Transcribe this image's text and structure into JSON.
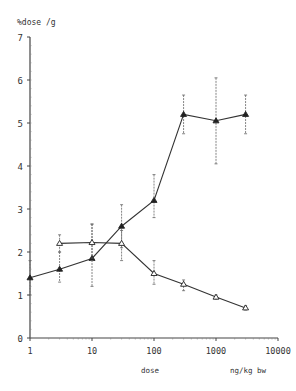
{
  "chart_data": {
    "type": "line",
    "title": "",
    "ylabel": "%dose /g",
    "xlabel": "dose",
    "xunit": "ng/kg bw",
    "xscale": "log",
    "xlim": [
      1,
      10000
    ],
    "ylim": [
      0,
      7
    ],
    "x_ticks": [
      "1",
      "10",
      "100",
      "1000",
      "10000"
    ],
    "y_ticks": [
      "0",
      "1",
      "2",
      "3",
      "4",
      "5",
      "6",
      "7"
    ],
    "grid": false,
    "legend": null,
    "series": [
      {
        "name": "rising series (filled triangles)",
        "marker": "filled-triangle",
        "x": [
          1,
          3,
          10,
          30,
          100,
          300,
          1000,
          3000
        ],
        "y": [
          1.4,
          1.6,
          1.85,
          2.6,
          3.2,
          5.2,
          5.05,
          5.2
        ],
        "err_low": [
          1.0,
          1.3,
          1.2,
          2.1,
          2.8,
          4.75,
          4.05,
          4.75
        ],
        "err_high": [
          1.8,
          2.0,
          2.65,
          3.1,
          3.8,
          5.65,
          6.05,
          5.65
        ]
      },
      {
        "name": "falling series (open triangles)",
        "marker": "open-triangle",
        "x": [
          3,
          10,
          30,
          100,
          300,
          1000,
          3000
        ],
        "y": [
          2.2,
          2.22,
          2.2,
          1.5,
          1.25,
          0.95,
          0.7
        ],
        "err_low": [
          2.0,
          1.8,
          1.8,
          1.25,
          1.1,
          0.9,
          0.65
        ],
        "err_high": [
          2.4,
          2.65,
          2.5,
          1.8,
          1.35,
          1.0,
          0.75
        ]
      }
    ]
  }
}
